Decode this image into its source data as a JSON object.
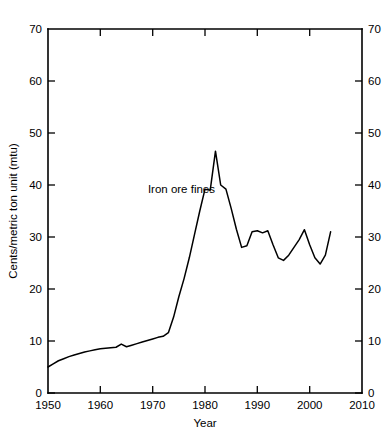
{
  "chart_data": {
    "type": "line",
    "title": "",
    "xlabel": "Year",
    "ylabel": "Cents/metric ton unit (mtu)",
    "xlim": [
      1950,
      2010
    ],
    "ylim": [
      0,
      70
    ],
    "grid": false,
    "legend_position": "inline-annotation",
    "x_ticks": [
      1950,
      1960,
      1970,
      1980,
      1990,
      2000,
      2010
    ],
    "x_tick_labels": [
      "1950",
      "1960",
      "1970",
      "1980",
      "1990",
      "2000",
      "2010"
    ],
    "y_ticks": [
      0,
      10,
      20,
      30,
      40,
      50,
      60,
      70
    ],
    "y_tick_labels": [
      "0",
      "10",
      "20",
      "30",
      "40",
      "50",
      "60",
      "70"
    ],
    "right_axis_ticks": [
      0,
      10,
      20,
      30,
      40,
      50,
      60,
      70
    ],
    "right_axis_tick_labels": [
      "0",
      "10",
      "20",
      "30",
      "40",
      "50",
      "60",
      "70"
    ],
    "line_color": "#000000",
    "background_color": "#ffffff",
    "annotations": [
      {
        "text": "Iron ore fines",
        "x": 1975.5,
        "y": 38.5
      }
    ],
    "series": [
      {
        "name": "Iron ore fines",
        "x": [
          1950,
          1951,
          1952,
          1953,
          1954,
          1955,
          1956,
          1957,
          1958,
          1959,
          1960,
          1961,
          1962,
          1963,
          1964,
          1965,
          1966,
          1967,
          1968,
          1969,
          1970,
          1971,
          1972,
          1973,
          1974,
          1975,
          1976,
          1977,
          1978,
          1979,
          1980,
          1981,
          1982,
          1983,
          1984,
          1985,
          1986,
          1987,
          1988,
          1989,
          1990,
          1991,
          1992,
          1993,
          1994,
          1995,
          1996,
          1997,
          1998,
          1999,
          2000,
          2001,
          2002,
          2003,
          2004
        ],
        "values": [
          5.0,
          5.6,
          6.2,
          6.6,
          7.0,
          7.3,
          7.6,
          7.9,
          8.1,
          8.3,
          8.5,
          8.6,
          8.7,
          8.8,
          9.4,
          8.9,
          9.2,
          9.5,
          9.8,
          10.1,
          10.4,
          10.7,
          10.9,
          11.6,
          14.6,
          18.5,
          22.0,
          26.0,
          30.5,
          35.0,
          39.2,
          39.0,
          46.5,
          40.0,
          39.2,
          35.5,
          31.5,
          28.0,
          28.3,
          31.0,
          31.2,
          30.8,
          31.2,
          28.5,
          26.0,
          25.5,
          26.5,
          28.0,
          29.5,
          31.4,
          28.5,
          26.0,
          24.8,
          26.5,
          31.0
        ]
      }
    ]
  },
  "figure": {
    "y_axis_title": "Cents/metric ton unit (mtu)",
    "x_axis_title": "Year",
    "series_label": "Iron ore fines"
  }
}
